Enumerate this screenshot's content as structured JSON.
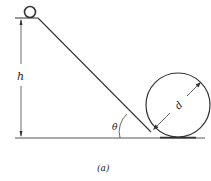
{
  "diagram": {
    "labels": {
      "height": "h",
      "angle": "θ",
      "diameter": "d",
      "caption": "(a)"
    },
    "colors": {
      "stroke": "#333333",
      "background": "#ffffff"
    }
  }
}
